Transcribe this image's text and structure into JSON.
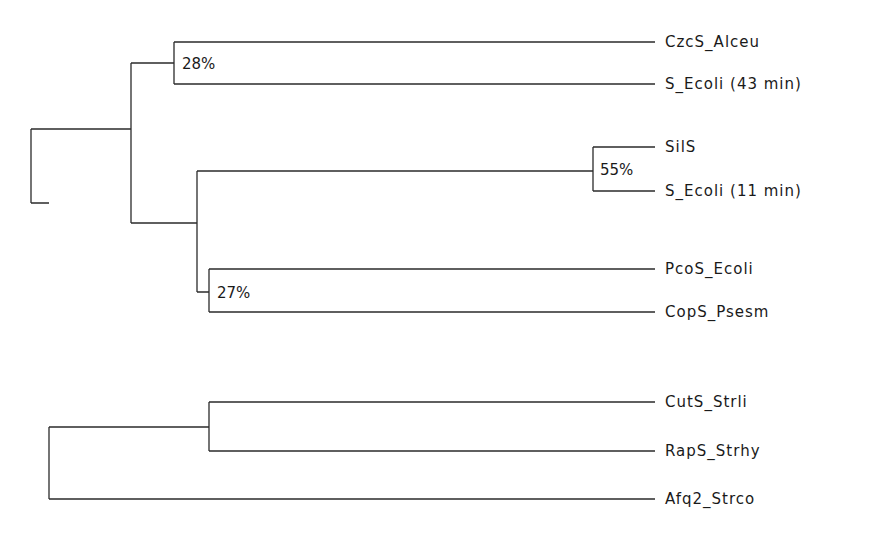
{
  "tree": {
    "type": "phylogenetic-dendrogram",
    "leaves": [
      {
        "id": "czcs",
        "label": "CzcS_Alceu",
        "y": 42
      },
      {
        "id": "secoli43",
        "label": "S_Ecoli (43 min)",
        "y": 84
      },
      {
        "id": "sils",
        "label": "SilS",
        "y": 147
      },
      {
        "id": "secoli11",
        "label": "S_Ecoli (11 min)",
        "y": 191
      },
      {
        "id": "pcos",
        "label": "PcoS_Ecoli",
        "y": 269
      },
      {
        "id": "cops",
        "label": "CopS_Psesm",
        "y": 312
      },
      {
        "id": "cuts",
        "label": "CutS_Strli",
        "y": 402
      },
      {
        "id": "raps",
        "label": "RapS_Strhy",
        "y": 451
      },
      {
        "id": "afq2",
        "label": "Afq2_Strco",
        "y": 499
      }
    ],
    "support_values": [
      {
        "label": "28%",
        "clade": [
          "CzcS_Alceu",
          "S_Ecoli (43 min)"
        ]
      },
      {
        "label": "55%",
        "clade": [
          "SilS",
          "S_Ecoli (11 min)"
        ]
      },
      {
        "label": "27%",
        "clade": [
          "PcoS_Ecoli",
          "CopS_Psesm"
        ]
      }
    ],
    "colors": {
      "line": "#2b2b2b",
      "text": "#1a1a1a",
      "background": "#ffffff"
    }
  }
}
